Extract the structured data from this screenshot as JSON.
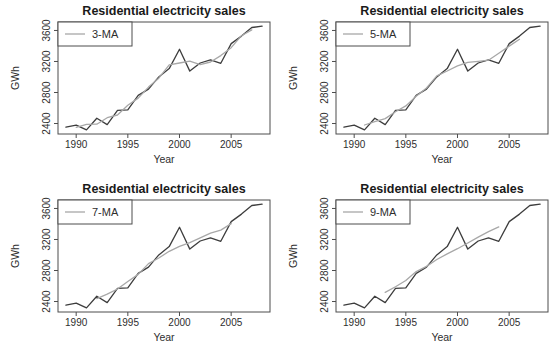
{
  "figure": {
    "background": "#ffffff"
  },
  "style": {
    "data_color": "#3d3d3d",
    "ma_color": "#a8a8a8",
    "axis_color": "#4d4d4d",
    "text_color": "#2e2e2e",
    "title_color": "#1a1a1a",
    "legend_fill": "#ffffff"
  },
  "chart_data": [
    {
      "type": "line",
      "title": "Residential electricity sales",
      "xlabel": "Year",
      "ylabel": "GWh",
      "legend": {
        "label": "3-MA",
        "position": "topleft"
      },
      "xlim": [
        1988.24,
        2008.76
      ],
      "ylim": [
        2265,
        3709
      ],
      "xticks": [
        1990,
        1995,
        2000,
        2005
      ],
      "yticks": [
        2400,
        2800,
        3200,
        3600
      ],
      "grid": false,
      "series": [
        {
          "name": "elecsales-data",
          "color_key": "data",
          "x": [
            1989,
            1990,
            1991,
            1992,
            1993,
            1994,
            1995,
            1996,
            1997,
            1998,
            1999,
            2000,
            2001,
            2002,
            2003,
            2004,
            2005,
            2006,
            2007,
            2008
          ],
          "values": [
            2354.3,
            2379.7,
            2318.5,
            2469.0,
            2386.1,
            2569.5,
            2575.7,
            2762.7,
            2844.5,
            3000.7,
            3108.1,
            3357.5,
            3075.7,
            3180.6,
            3221.6,
            3176.2,
            3430.6,
            3527.5,
            3637.9,
            3655.0
          ]
        },
        {
          "name": "3-MA",
          "color_key": "ma",
          "x": [
            1990,
            1991,
            1992,
            1993,
            1994,
            1995,
            1996,
            1997,
            1998,
            1999,
            2000,
            2001,
            2002,
            2003,
            2004,
            2005,
            2006,
            2007
          ],
          "values": [
            2350.9,
            2389.1,
            2391.2,
            2474.9,
            2510.4,
            2636.0,
            2727.6,
            2869.3,
            2984.4,
            3155.4,
            3180.4,
            3204.6,
            3159.3,
            3192.8,
            3276.1,
            3378.1,
            3532.0,
            3606.8
          ]
        }
      ]
    },
    {
      "type": "line",
      "title": "Residential electricity sales",
      "xlabel": "Year",
      "ylabel": "GWh",
      "legend": {
        "label": "5-MA",
        "position": "topleft"
      },
      "xlim": [
        1988.24,
        2008.76
      ],
      "ylim": [
        2265,
        3709
      ],
      "xticks": [
        1990,
        1995,
        2000,
        2005
      ],
      "yticks": [
        2400,
        2800,
        3200,
        3600
      ],
      "grid": false,
      "series": [
        {
          "name": "elecsales-data",
          "color_key": "data",
          "x": [
            1989,
            1990,
            1991,
            1992,
            1993,
            1994,
            1995,
            1996,
            1997,
            1998,
            1999,
            2000,
            2001,
            2002,
            2003,
            2004,
            2005,
            2006,
            2007,
            2008
          ],
          "values": [
            2354.3,
            2379.7,
            2318.5,
            2469.0,
            2386.1,
            2569.5,
            2575.7,
            2762.7,
            2844.5,
            3000.7,
            3108.1,
            3357.5,
            3075.7,
            3180.6,
            3221.6,
            3176.2,
            3430.6,
            3527.5,
            3637.9,
            3655.0
          ]
        },
        {
          "name": "5-MA",
          "color_key": "ma",
          "x": [
            1991,
            1992,
            1993,
            1994,
            1995,
            1996,
            1997,
            1998,
            1999,
            2000,
            2001,
            2002,
            2003,
            2004,
            2005,
            2006
          ],
          "values": [
            2381.5,
            2424.6,
            2463.8,
            2552.6,
            2627.7,
            2750.6,
            2858.3,
            3014.7,
            3077.3,
            3144.5,
            3188.7,
            3202.3,
            3216.9,
            3307.3,
            3398.8,
            3485.4
          ]
        }
      ]
    },
    {
      "type": "line",
      "title": "Residential electricity sales",
      "xlabel": "Year",
      "ylabel": "GWh",
      "legend": {
        "label": "7-MA",
        "position": "topleft"
      },
      "xlim": [
        1988.24,
        2008.76
      ],
      "ylim": [
        2265,
        3709
      ],
      "xticks": [
        1990,
        1995,
        2000,
        2005
      ],
      "yticks": [
        2400,
        2800,
        3200,
        3600
      ],
      "grid": false,
      "series": [
        {
          "name": "elecsales-data",
          "color_key": "data",
          "x": [
            1989,
            1990,
            1991,
            1992,
            1993,
            1994,
            1995,
            1996,
            1997,
            1998,
            1999,
            2000,
            2001,
            2002,
            2003,
            2004,
            2005,
            2006,
            2007,
            2008
          ],
          "values": [
            2354.3,
            2379.7,
            2318.5,
            2469.0,
            2386.1,
            2569.5,
            2575.7,
            2762.7,
            2844.5,
            3000.7,
            3108.1,
            3357.5,
            3075.7,
            3180.6,
            3221.6,
            3176.2,
            3430.6,
            3527.5,
            3637.9,
            3655.0
          ]
        },
        {
          "name": "7-MA",
          "color_key": "ma",
          "x": [
            1992,
            1993,
            1994,
            1995,
            1996,
            1997,
            1998,
            1999,
            2000,
            2001,
            2002,
            2003,
            2004,
            2005
          ],
          "values": [
            2436.1,
            2494.5,
            2560.9,
            2658.3,
            2749.6,
            2888.4,
            2960.7,
            3047.1,
            3112.7,
            3160.1,
            3221.5,
            3281.4,
            3321.4,
            3404.2
          ]
        }
      ]
    },
    {
      "type": "line",
      "title": "Residential electricity sales",
      "xlabel": "Year",
      "ylabel": "GWh",
      "legend": {
        "label": "9-MA",
        "position": "topleft"
      },
      "xlim": [
        1988.24,
        2008.76
      ],
      "ylim": [
        2265,
        3709
      ],
      "xticks": [
        1990,
        1995,
        2000,
        2005
      ],
      "yticks": [
        2400,
        2800,
        3200,
        3600
      ],
      "grid": false,
      "series": [
        {
          "name": "elecsales-data",
          "color_key": "data",
          "x": [
            1989,
            1990,
            1991,
            1992,
            1993,
            1994,
            1995,
            1996,
            1997,
            1998,
            1999,
            2000,
            2001,
            2002,
            2003,
            2004,
            2005,
            2006,
            2007,
            2008
          ],
          "values": [
            2354.3,
            2379.7,
            2318.5,
            2469.0,
            2386.1,
            2569.5,
            2575.7,
            2762.7,
            2844.5,
            3000.7,
            3108.1,
            3357.5,
            3075.7,
            3180.6,
            3221.6,
            3176.2,
            3430.6,
            3527.5,
            3637.9,
            3655.0
          ]
        },
        {
          "name": "9-MA",
          "color_key": "ma",
          "x": [
            1993,
            1994,
            1995,
            1996,
            1997,
            1998,
            1999,
            2000,
            2001,
            2002,
            2003,
            2004
          ],
          "values": [
            2517.8,
            2589.6,
            2670.5,
            2786.0,
            2853.4,
            2941.7,
            3014.1,
            3080.8,
            3155.1,
            3230.9,
            3301.7,
            3362.5
          ]
        }
      ]
    }
  ]
}
